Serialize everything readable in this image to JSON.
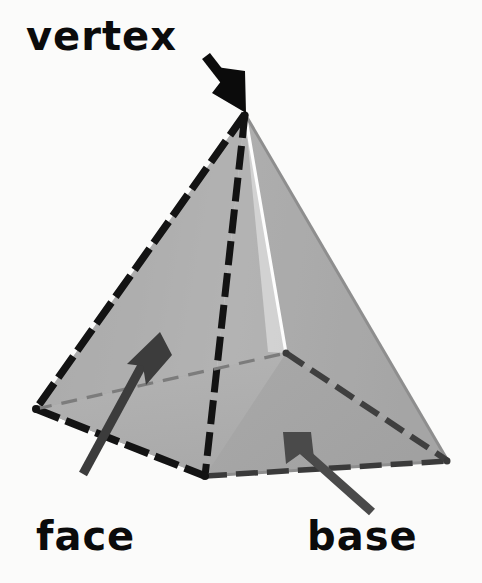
{
  "figure": {
    "background_color": "#fbfbfa"
  },
  "labels": {
    "vertex": "vertex",
    "face": "face",
    "base": "base"
  },
  "colors": {
    "background": "#fbfbfa",
    "face_left": "#a3a3a3",
    "face_right": "#adadad",
    "face_front_left": "#b0b0b0",
    "face_front_right": "#a8a8a8",
    "highlight_edge": "#fdfdfd",
    "edge_dash": "#131313",
    "edge_thin": "#8f8f8f",
    "hidden_edge": "#5b5b5b",
    "arrow_vertex": "#0b0b0b",
    "arrow_face": "#3c3c3c",
    "arrow_base": "#4a4a4a",
    "label_text": "#0b0b0b"
  },
  "geometry": {
    "apex": [
      245,
      114
    ],
    "base_left": [
      36,
      409
    ],
    "base_front": [
      205,
      476
    ],
    "base_right": [
      448,
      461
    ],
    "base_back": [
      286,
      353
    ]
  },
  "annotations": [
    {
      "name": "vertex-arrow",
      "label": "vertex",
      "tail": [
        206,
        63
      ],
      "tip": [
        244,
        112
      ],
      "color": "#0b0b0b",
      "points_to": "apex"
    },
    {
      "name": "face-arrow",
      "label": "face",
      "tail": [
        84,
        474
      ],
      "tip": [
        159,
        333
      ],
      "color": "#3c3c3c",
      "points_to": "left triangular face"
    },
    {
      "name": "base-arrow",
      "label": "base",
      "tail": [
        372,
        512
      ],
      "tip": [
        284,
        433
      ],
      "color": "#4a4a4a",
      "points_to": "square base"
    }
  ]
}
